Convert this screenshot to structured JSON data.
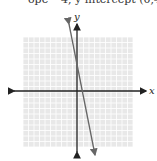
{
  "caption": "ope −4, y-intercept (0,4)",
  "chart_data": {
    "type": "line",
    "title": "ope −4, y-intercept (0,4)",
    "xlabel": "x",
    "ylabel": "y",
    "xlim": [
      -10,
      10
    ],
    "ylim": [
      -10,
      10
    ],
    "grid": true,
    "series": [
      {
        "name": "line",
        "x": [
          -1.5,
          3.5
        ],
        "y": [
          10,
          -10
        ],
        "slope": -4,
        "intercept": 4
      }
    ]
  },
  "axes": {
    "x_label": "x",
    "y_label": "y"
  },
  "colors": {
    "grid": "#d9d9d9",
    "gridbg": "#e8e8e8",
    "axis": "#222222",
    "line": "#666666"
  }
}
